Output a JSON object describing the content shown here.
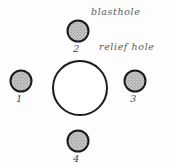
{
  "diagram": {
    "background_color": "#fdfdfd",
    "annotations": [
      {
        "text": "blasthole",
        "x": 91,
        "y": 7
      },
      {
        "text": "relief hole",
        "x": 99,
        "y": 42
      }
    ],
    "relief_hole": {
      "name": "relief hole",
      "cx": 80,
      "cy": 88,
      "r": 28,
      "fill": "#ffffff",
      "stroke": "#1a1a1a",
      "stroke_width": 2
    },
    "blastholes": [
      {
        "label": "1",
        "cx": 21,
        "cy": 81,
        "r": 11,
        "label_x": 16,
        "label_y": 94,
        "fill": "#b6b6b6",
        "stroke": "#1a1a1a"
      },
      {
        "label": "2",
        "cx": 78,
        "cy": 31,
        "r": 11,
        "label_x": 73,
        "label_y": 44,
        "fill": "#b6b6b6",
        "stroke": "#1a1a1a"
      },
      {
        "label": "3",
        "cx": 135,
        "cy": 81,
        "r": 11,
        "label_x": 130,
        "label_y": 94,
        "fill": "#b6b6b6",
        "stroke": "#1a1a1a"
      },
      {
        "label": "4",
        "cx": 78,
        "cy": 141,
        "r": 11,
        "label_x": 73,
        "label_y": 154,
        "fill": "#b6b6b6",
        "stroke": "#1a1a1a"
      }
    ]
  }
}
